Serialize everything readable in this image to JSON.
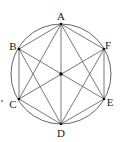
{
  "diagram": {
    "type": "geometry",
    "circle": {
      "cx": 61,
      "cy": 74,
      "r": 50
    },
    "center": {
      "x": 61,
      "y": 74
    },
    "stray_dot": {
      "x": 2,
      "y": 101
    },
    "colors": {
      "stroke": "#555555",
      "point": "#111111",
      "label": "#222222"
    },
    "vertices": [
      {
        "name": "A",
        "x": 61,
        "y": 24,
        "lx": 61,
        "ly": 20
      },
      {
        "name": "B",
        "x": 19,
        "y": 49,
        "lx": 13,
        "ly": 50
      },
      {
        "name": "C",
        "x": 19,
        "y": 99,
        "lx": 13,
        "ly": 108
      },
      {
        "name": "D",
        "x": 61,
        "y": 124,
        "lx": 61,
        "ly": 137
      },
      {
        "name": "E",
        "x": 104,
        "y": 99,
        "lx": 110,
        "ly": 106
      },
      {
        "name": "F",
        "x": 104,
        "y": 49,
        "lx": 108,
        "ly": 49
      }
    ],
    "edges": [
      [
        "A",
        "B"
      ],
      [
        "B",
        "C"
      ],
      [
        "C",
        "D"
      ],
      [
        "D",
        "E"
      ],
      [
        "E",
        "F"
      ],
      [
        "F",
        "A"
      ],
      [
        "A",
        "C"
      ],
      [
        "A",
        "E"
      ],
      [
        "B",
        "D"
      ],
      [
        "F",
        "D"
      ],
      [
        "A",
        "D"
      ],
      [
        "B",
        "E"
      ],
      [
        "F",
        "C"
      ]
    ]
  }
}
